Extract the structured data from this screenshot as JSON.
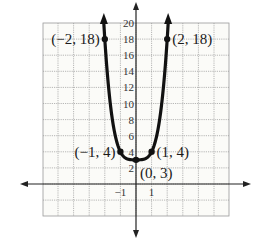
{
  "chart_data": {
    "type": "line",
    "title": "",
    "xlabel": "",
    "ylabel": "",
    "xlim": [
      -6,
      6
    ],
    "ylim": [
      -4,
      20
    ],
    "grid": true,
    "x_ticks": [
      {
        "value": -1,
        "label": "−1"
      },
      {
        "value": 1,
        "label": "1"
      }
    ],
    "y_ticks": [
      {
        "value": 2,
        "label": "2"
      },
      {
        "value": 4,
        "label": "4"
      },
      {
        "value": 6,
        "label": "6"
      },
      {
        "value": 8,
        "label": "8"
      },
      {
        "value": 10,
        "label": "10"
      },
      {
        "value": 12,
        "label": "12"
      },
      {
        "value": 14,
        "label": "14"
      },
      {
        "value": 16,
        "label": "16"
      },
      {
        "value": 18,
        "label": "18"
      },
      {
        "value": 20,
        "label": "20"
      }
    ],
    "series": [
      {
        "name": "curve",
        "description": "U-shaped curve through labeled points, arrows at both ends pointing up",
        "x": [
          -2,
          -1,
          0,
          1,
          2
        ],
        "y": [
          18,
          4,
          3,
          4,
          18
        ]
      }
    ],
    "annotations": [
      {
        "x": -2,
        "y": 18,
        "label": "(−2, 18)"
      },
      {
        "x": 2,
        "y": 18,
        "label": "(2, 18)"
      },
      {
        "x": -1,
        "y": 4,
        "label": "(−1, 4)"
      },
      {
        "x": 1,
        "y": 4,
        "label": "(1, 4)"
      },
      {
        "x": 0,
        "y": 3,
        "label": "(0, 3)"
      }
    ]
  },
  "colors": {
    "curve": "#111111",
    "axis": "#222222",
    "grid": "#9a9a9a"
  }
}
